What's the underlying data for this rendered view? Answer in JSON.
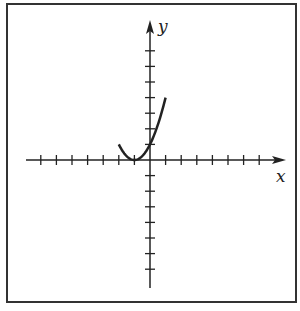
{
  "chart_data": {
    "type": "line",
    "title": "",
    "function": "y = (x + 1)^2",
    "xlabel": "x",
    "ylabel": "y",
    "xlim": [
      -7,
      7
    ],
    "ylim": [
      -7,
      7
    ],
    "x_ticks": [
      -7,
      -6,
      -5,
      -4,
      -3,
      -2,
      -1,
      1,
      2,
      3,
      4,
      5,
      6,
      7
    ],
    "y_ticks": [
      -7,
      -6,
      -5,
      -4,
      -3,
      -2,
      -1,
      1,
      2,
      3,
      4,
      5,
      6,
      7
    ],
    "tick_labels_shown": false,
    "grid": false,
    "series": [
      {
        "name": "parabola",
        "x": [
          -2,
          -1.5,
          -1,
          -0.5,
          0,
          0.5,
          1
        ],
        "y": [
          3,
          1,
          0,
          0.25,
          1,
          2.25,
          3
        ]
      }
    ],
    "vertex": [
      -1,
      0
    ]
  },
  "labels": {
    "x_axis": "x",
    "y_axis": "y"
  }
}
